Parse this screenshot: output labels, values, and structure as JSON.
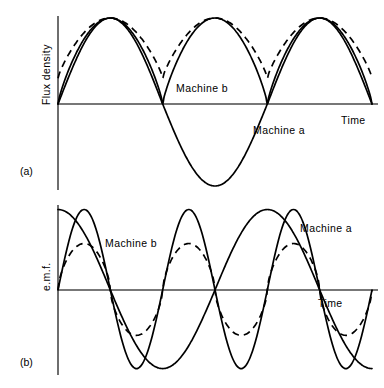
{
  "figure": {
    "panels": [
      {
        "id": "(a)",
        "y_axis_label": "Flux density",
        "x_axis_label": "Time",
        "annotations": [
          {
            "name": "machine-b-label",
            "text": "Machine  b",
            "x": 176,
            "y": 92
          },
          {
            "name": "machine-a-label",
            "text": "Machine  a",
            "x": 253,
            "y": 134
          }
        ]
      },
      {
        "id": "(b)",
        "y_axis_label": "e.m.f.",
        "x_axis_label": "Time",
        "annotations": [
          {
            "name": "machine-b-label",
            "text": "Machine  b",
            "x": 105,
            "y": 247
          },
          {
            "name": "machine-a-label",
            "text": "Machine  a",
            "x": 300,
            "y": 232
          }
        ]
      }
    ]
  },
  "chart_data": [
    {
      "type": "line",
      "panel": "(a)",
      "title": "Flux density waveforms",
      "xlabel": "Time",
      "ylabel": "Flux density",
      "grid": false,
      "legend": "inline-annotations",
      "axis": {
        "origin_x": 58,
        "zero_y": 104,
        "x_end": 384,
        "y_top": 16,
        "y_bottom": 190
      },
      "x": [
        0,
        0.5,
        1,
        1.5,
        2,
        2.5,
        3
      ],
      "xlim": [
        0,
        3
      ],
      "ylim": [
        -1.05,
        1.05
      ],
      "series": [
        {
          "name": "Machine a",
          "style": "solid",
          "description": "sinusoidal flux wave, one positive half-cycle then deep negative half-cycle, period 2 units",
          "period": 2.0,
          "amplitude": 1.0,
          "points_ty": [
            [
              0,
              0
            ],
            [
              0.25,
              0.72
            ],
            [
              0.5,
              1.0
            ],
            [
              0.75,
              0.72
            ],
            [
              1.0,
              0
            ],
            [
              1.25,
              -0.72
            ],
            [
              1.5,
              -1.0
            ],
            [
              1.75,
              -0.72
            ],
            [
              2.0,
              0
            ],
            [
              2.25,
              0.72
            ],
            [
              2.5,
              1.0
            ],
            [
              2.75,
              0.72
            ],
            [
              3.0,
              0
            ]
          ]
        },
        {
          "name": "Machine a rectified ripple",
          "style": "solid",
          "description": "flat-topped rectified flux pulses, three positive humps touching zero",
          "period": 1.0,
          "amplitude": 1.0,
          "points_ty": [
            [
              0,
              0
            ],
            [
              0.2,
              0.7
            ],
            [
              0.5,
              1.0
            ],
            [
              0.8,
              0.7
            ],
            [
              1.0,
              0
            ],
            [
              1.2,
              0.7
            ],
            [
              1.5,
              1.0
            ],
            [
              1.8,
              0.7
            ],
            [
              2.0,
              0
            ],
            [
              2.2,
              0.7
            ],
            [
              2.5,
              1.0
            ],
            [
              2.8,
              0.7
            ],
            [
              3.0,
              0
            ]
          ]
        },
        {
          "name": "Machine b",
          "style": "dashed",
          "description": "flux wave with large d.c. offset, minima never reach zero (about 0.30 of peak)",
          "period": 1.0,
          "amplitude_max": 1.0,
          "amplitude_min": 0.3,
          "points_ty": [
            [
              0,
              0.33
            ],
            [
              0.25,
              0.82
            ],
            [
              0.5,
              1.0
            ],
            [
              0.75,
              0.82
            ],
            [
              1.0,
              0.3
            ],
            [
              1.25,
              0.82
            ],
            [
              1.5,
              1.0
            ],
            [
              1.75,
              0.82
            ],
            [
              2.0,
              0.3
            ],
            [
              2.25,
              0.82
            ],
            [
              2.5,
              1.0
            ],
            [
              2.75,
              0.82
            ],
            [
              3.0,
              0.3
            ]
          ]
        }
      ]
    },
    {
      "type": "line",
      "panel": "(b)",
      "title": "e.m.f. waveforms",
      "xlabel": "Time",
      "ylabel": "e.m.f.",
      "grid": false,
      "legend": "inline-annotations",
      "axis": {
        "origin_x": 58,
        "zero_y": 290,
        "x_end": 384,
        "y_top": 205,
        "y_bottom": 375
      },
      "x": [
        0,
        0.5,
        1,
        1.5,
        2,
        2.5,
        3
      ],
      "xlim": [
        0,
        3
      ],
      "ylim": [
        -1.05,
        1.05
      ],
      "series": [
        {
          "name": "Machine a",
          "style": "solid",
          "description": "low-frequency sine, starts near positive peak, period 2 units, one and a half cycles",
          "period": 2.0,
          "amplitude": 1.0,
          "points_ty": [
            [
              0,
              0.95
            ],
            [
              0.25,
              0.7
            ],
            [
              0.5,
              0
            ],
            [
              0.75,
              -0.7
            ],
            [
              1.0,
              -0.98
            ],
            [
              1.25,
              -0.7
            ],
            [
              1.5,
              0
            ],
            [
              1.75,
              0.7
            ],
            [
              2.0,
              0.98
            ],
            [
              2.25,
              0.7
            ],
            [
              2.5,
              0
            ],
            [
              2.75,
              -0.7
            ],
            [
              3.0,
              -0.95
            ]
          ]
        },
        {
          "name": "Machine b",
          "style": "solid",
          "description": "high-frequency e.m.f., period 1 unit, full amplitude, starts at zero rising",
          "period": 1.0,
          "amplitude": 1.0,
          "points_ty": [
            [
              0,
              0
            ],
            [
              0.25,
              0.95
            ],
            [
              0.5,
              0
            ],
            [
              0.75,
              -0.95
            ],
            [
              1.0,
              0
            ],
            [
              1.25,
              0.95
            ],
            [
              1.5,
              0
            ],
            [
              1.75,
              -0.95
            ],
            [
              2.0,
              0
            ],
            [
              2.25,
              0.95
            ],
            [
              2.5,
              0
            ],
            [
              2.75,
              -0.95
            ],
            [
              3.0,
              0
            ]
          ]
        },
        {
          "name": "Machine b reduced",
          "style": "dashed",
          "description": "same frequency as Machine b but flattened peaks at about 0.55 amplitude",
          "period": 1.0,
          "amplitude": 0.55,
          "points_ty": [
            [
              0,
              0
            ],
            [
              0.25,
              0.55
            ],
            [
              0.5,
              0
            ],
            [
              0.75,
              -0.55
            ],
            [
              1.0,
              0
            ],
            [
              1.25,
              0.55
            ],
            [
              1.5,
              0
            ],
            [
              1.75,
              -0.55
            ],
            [
              2.0,
              0
            ],
            [
              2.25,
              0.55
            ],
            [
              2.5,
              0
            ],
            [
              2.75,
              -0.55
            ],
            [
              3.0,
              0
            ]
          ]
        }
      ]
    }
  ]
}
